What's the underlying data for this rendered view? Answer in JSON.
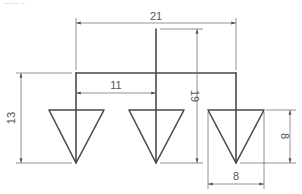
{
  "header": {
    "label": "~~~ ~"
  },
  "drawing": {
    "dimensions": {
      "overall_width": "21",
      "spacing": "11",
      "height_left": "13",
      "height_center": "19",
      "triangle_height": "8",
      "triangle_width": "8"
    },
    "triangles": [
      {
        "name": "left",
        "apex_x": 76
      },
      {
        "name": "center",
        "apex_x": 156
      },
      {
        "name": "right",
        "apex_x": 236
      }
    ],
    "colors": {
      "outline": "#4a4a4a",
      "dimension": "#777777"
    }
  }
}
